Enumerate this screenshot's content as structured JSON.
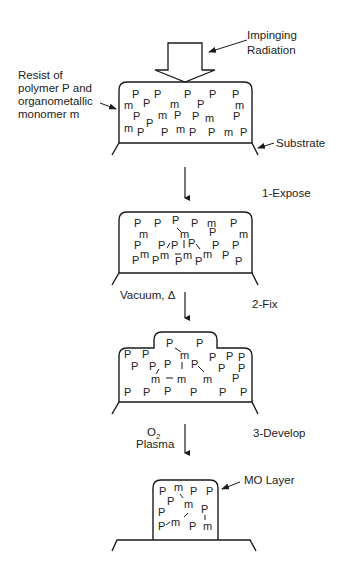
{
  "labels": {
    "radiation": [
      "Impinging",
      "Radiation"
    ],
    "resist": [
      "Resist of",
      "polymer P and",
      "organometallic",
      "monomer m"
    ],
    "substrate": "Substrate",
    "step1": "1-Expose",
    "step2": "2-Fix",
    "step2_condition": "Vacuum, Δ",
    "step3": "3-Develop",
    "step3_condition_line1": "O",
    "step3_condition_sub": "2",
    "step3_condition_line2": "Plasma",
    "mo_layer": "MO Layer"
  },
  "stages": [
    {
      "name": "initial-resist",
      "symbols": "P and m randomly dispersed"
    },
    {
      "name": "exposed-resist",
      "symbols": "m bonded to P and m"
    },
    {
      "name": "fixed-resist",
      "symbols": "exposed region swells"
    },
    {
      "name": "developed-pattern",
      "symbols": "MO layer remains"
    }
  ],
  "colors": {
    "line": "#1a1a1a",
    "background": "#ffffff"
  }
}
